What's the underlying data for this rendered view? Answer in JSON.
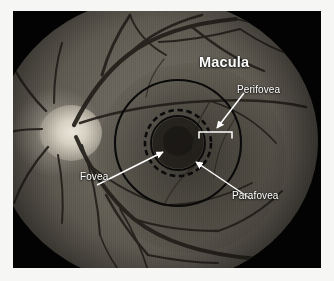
{
  "image": {
    "kind": "retinal-fundus-photograph",
    "subject": "Macular anatomy zones of the human retina",
    "plate_background_color": "#030303",
    "paper_background_color": "#f6f6f5",
    "annotation_color": "#ffffff",
    "overlay_line_color": "#0a0a0a"
  },
  "annotations": {
    "macula": {
      "label": "Macula",
      "style": "bold",
      "role": "region-title"
    },
    "perifovea": {
      "label": "Perifovea",
      "role": "zone-callout",
      "marker": "span-bracket"
    },
    "fovea": {
      "label": "Fovea",
      "role": "zone-callout",
      "marker": "arrow"
    },
    "parafovea": {
      "label": "Parafovea",
      "role": "zone-callout",
      "marker": "arrow"
    }
  },
  "overlay_zones": [
    {
      "name": "outer-macula-circle",
      "shape": "circle",
      "stroke": "solid",
      "cx": 165,
      "cy": 132,
      "r": 63
    },
    {
      "name": "parafovea-dashed-circle",
      "shape": "circle",
      "stroke": "dashed",
      "cx": 165,
      "cy": 132,
      "r": 33
    },
    {
      "name": "fovea-inner-circle",
      "shape": "circle",
      "stroke": "solid",
      "cx": 165,
      "cy": 132,
      "r": 27
    }
  ],
  "anatomy_features": [
    {
      "name": "optic-disc",
      "appearance": "bright-oval",
      "cx": 57,
      "cy": 122
    },
    {
      "name": "foveal-pit",
      "appearance": "dark-disc",
      "cx": 165,
      "cy": 132
    },
    {
      "name": "vascular-arcades",
      "appearance": "branching-dark-vessels"
    }
  ]
}
